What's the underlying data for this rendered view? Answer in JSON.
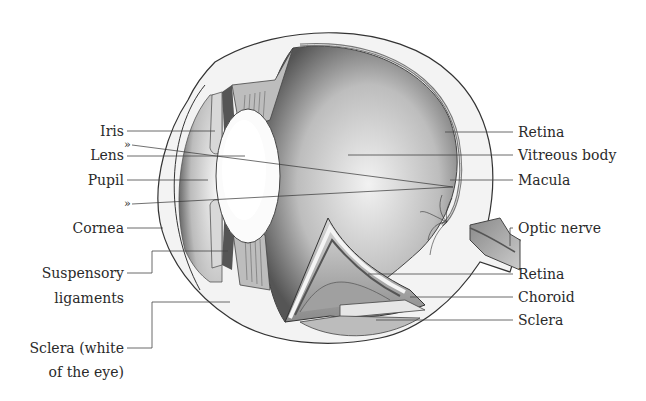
{
  "diagram": {
    "left_labels": [
      {
        "id": "iris",
        "text": "Iris"
      },
      {
        "id": "lens",
        "text": "Lens"
      },
      {
        "id": "pupil",
        "text": "Pupil"
      },
      {
        "id": "cornea",
        "text": "Cornea"
      },
      {
        "id": "suspensory_1",
        "text": "Suspensory"
      },
      {
        "id": "suspensory_2",
        "text": "ligaments"
      },
      {
        "id": "sclera_white_1",
        "text": "Sclera (white"
      },
      {
        "id": "sclera_white_2",
        "text": "of the eye)"
      }
    ],
    "right_labels": [
      {
        "id": "retina_top",
        "text": "Retina"
      },
      {
        "id": "vitreous",
        "text": "Vitreous body"
      },
      {
        "id": "macula",
        "text": "Macula"
      },
      {
        "id": "optic_nerve",
        "text": "Optic nerve"
      },
      {
        "id": "retina_bottom",
        "text": "Retina"
      },
      {
        "id": "choroid",
        "text": "Choroid"
      },
      {
        "id": "sclera",
        "text": "Sclera"
      }
    ],
    "arrow_markers": [
      "»",
      "»"
    ]
  }
}
